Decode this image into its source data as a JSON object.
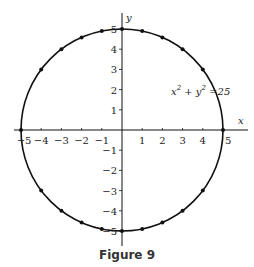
{
  "chart_data": {
    "type": "scatter",
    "title": "",
    "caption": "Figure 9",
    "equation": {
      "lhs_x": "x",
      "lhs_plus": "+",
      "lhs_y": "y",
      "exp": "2",
      "rhs": "=25"
    },
    "xlabel": "x",
    "ylabel": "y",
    "xlim": [
      -5,
      5
    ],
    "ylim": [
      -5,
      5
    ],
    "grid": false,
    "x_ticks": [
      -5,
      -4,
      -3,
      -2,
      -1,
      1,
      2,
      3,
      4,
      5
    ],
    "y_ticks": [
      -5,
      -4,
      -3,
      -2,
      -1,
      1,
      2,
      3,
      4,
      5
    ],
    "curve": {
      "type": "circle",
      "center": [
        0,
        0
      ],
      "radius": 5
    },
    "points": [
      [
        -5,
        0
      ],
      [
        -4,
        3
      ],
      [
        -3,
        4
      ],
      [
        -2,
        4.58
      ],
      [
        -1,
        4.9
      ],
      [
        0,
        5
      ],
      [
        1,
        4.9
      ],
      [
        2,
        4.58
      ],
      [
        3,
        4
      ],
      [
        4,
        3
      ],
      [
        5,
        0
      ],
      [
        -4,
        -3
      ],
      [
        -3,
        -4
      ],
      [
        -2,
        -4.58
      ],
      [
        -1,
        -4.9
      ],
      [
        0,
        -5
      ],
      [
        1,
        -4.9
      ],
      [
        2,
        -4.58
      ],
      [
        3,
        -4
      ],
      [
        4,
        -3
      ]
    ]
  },
  "labels": {
    "caption": "Figure 9",
    "x_axis": "x",
    "y_axis": "y"
  },
  "colors": {
    "ink": "#111111",
    "background": "#ffffff"
  }
}
